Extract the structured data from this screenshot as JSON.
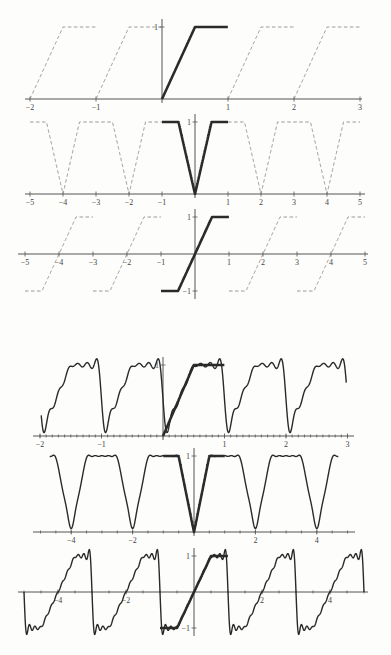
{
  "figure": {
    "caption_fragment": "",
    "panels_count": 6
  },
  "chart_data": [
    {
      "type": "line",
      "title": "Periodic extension of f (period 1)",
      "function_on_base": {
        "x": [
          0,
          0.5,
          1
        ],
        "y": [
          0,
          1,
          1
        ]
      },
      "extension": "periodic",
      "period": 1,
      "xlim": [
        -2,
        3
      ],
      "ylim": [
        0,
        1
      ],
      "xticks": [
        -2,
        -1,
        1,
        2,
        3
      ],
      "xtick_labels": [
        "−2",
        "−1",
        "1",
        "2",
        "3"
      ],
      "yticks": [
        1
      ],
      "ytick_labels": [
        "1"
      ],
      "series": [
        {
          "name": "f on [0,1]",
          "style": "solid-thick"
        },
        {
          "name": "periodic extension",
          "style": "dashed"
        }
      ],
      "px": {
        "x0": 162,
        "unit": 66,
        "y0": 99,
        "yunit": 72,
        "xmin": 25,
        "xmax": 362
      }
    },
    {
      "type": "line",
      "title": "Even extension of f (period 2)",
      "function_on_base": {
        "x": [
          -1,
          -0.5,
          0,
          0.5,
          1
        ],
        "y": [
          1,
          1,
          0,
          1,
          1
        ]
      },
      "extension": "even",
      "period": 2,
      "xlim": [
        -5,
        5
      ],
      "ylim": [
        0,
        1
      ],
      "xticks": [
        -5,
        -4,
        -3,
        -2,
        -1,
        1,
        2,
        3,
        4,
        5
      ],
      "xtick_labels": [
        "−5",
        "−4",
        "−3",
        "−2",
        "−1",
        "1",
        "2",
        "3",
        "4",
        "5"
      ],
      "yticks": [
        1
      ],
      "ytick_labels": [
        "1"
      ],
      "series": [
        {
          "name": "f even on [-1,1]",
          "style": "solid-thick"
        },
        {
          "name": "even periodic extension",
          "style": "dashed"
        }
      ],
      "px": {
        "x0": 195,
        "unit": 33,
        "y0": 194,
        "yunit": 72,
        "xmin": 25,
        "xmax": 365
      }
    },
    {
      "type": "line",
      "title": "Odd extension of f (period 2)",
      "function_on_base": {
        "x": [
          -1,
          -0.5,
          0,
          0.5,
          1
        ],
        "y": [
          -1,
          -1,
          0,
          1,
          1
        ]
      },
      "extension": "odd",
      "period": 2,
      "xlim": [
        -5,
        5
      ],
      "ylim": [
        -1,
        1
      ],
      "xticks": [
        -5,
        -4,
        -3,
        -2,
        -1,
        1,
        2,
        3,
        4,
        5
      ],
      "xtick_labels": [
        "−5",
        "−4",
        "−3",
        "−2",
        "−1",
        "1",
        "2",
        "3",
        "4",
        "5"
      ],
      "yticks": [
        1,
        -1
      ],
      "ytick_labels": [
        "1",
        "−1"
      ],
      "series": [
        {
          "name": "f odd on [-1,1]",
          "style": "solid-thick"
        },
        {
          "name": "odd periodic extension",
          "style": "dashed"
        }
      ],
      "px": {
        "x0": 195,
        "unit": 34,
        "y0": 254,
        "yunit": 37,
        "xmin": 18,
        "xmax": 368
      }
    },
    {
      "type": "line",
      "title": "Fourier partial sum of periodic extension",
      "extension": "periodic",
      "period": 1,
      "harmonics": 6,
      "xlim": [
        -2,
        3
      ],
      "ylim": [
        0,
        1
      ],
      "xticks": [
        -2,
        -1,
        1,
        2,
        3
      ],
      "xtick_labels": [
        "−2",
        "−1",
        "1",
        "2",
        "3"
      ],
      "minor_ticks_per_unit": 10,
      "yticks": [
        1
      ],
      "ytick_labels": [
        "1"
      ],
      "series": [
        {
          "name": "f on [0,1]",
          "style": "solid-thick"
        },
        {
          "name": "Fourier approximation",
          "style": "solid"
        }
      ],
      "px": {
        "x0": 163,
        "unit": 61.5,
        "y0": 436,
        "yunit": 71,
        "xmin": 33,
        "xmax": 354,
        "fmin": -1.98,
        "fmax": 2.98
      }
    },
    {
      "type": "line",
      "title": "Fourier cosine partial sum (even extension)",
      "extension": "even",
      "period": 2,
      "harmonics": 9,
      "xlim": [
        -5,
        5
      ],
      "ylim": [
        0,
        1
      ],
      "xticks": [
        -4,
        -2,
        2,
        4
      ],
      "xtick_labels": [
        "−4",
        "−2",
        "2",
        "4"
      ],
      "minor_ticks_per_unit": 2,
      "yticks": [
        1
      ],
      "ytick_labels": [
        "1"
      ],
      "series": [
        {
          "name": "f even on [-1,1]",
          "style": "solid-thick"
        },
        {
          "name": "Fourier cosine approximation",
          "style": "solid"
        }
      ],
      "px": {
        "x0": 194,
        "unit": 30.7,
        "y0": 532,
        "yunit": 76,
        "xmin": 33,
        "xmax": 355,
        "fmin": -4.7,
        "fmax": 4.7
      }
    },
    {
      "type": "line",
      "title": "Fourier sine partial sum (odd extension)",
      "extension": "odd",
      "period": 2,
      "harmonics": 12,
      "xlim": [
        -5,
        5
      ],
      "ylim": [
        -1,
        1
      ],
      "xticks": [
        -4,
        -2,
        2,
        4
      ],
      "xtick_labels": [
        "−4",
        "−2",
        "2",
        "4"
      ],
      "minor_ticks_per_unit": 2,
      "yticks": [
        1,
        -1
      ],
      "ytick_labels": [
        "1",
        "−1"
      ],
      "series": [
        {
          "name": "f odd on [-1,1]",
          "style": "solid-thick"
        },
        {
          "name": "Fourier sine approximation",
          "style": "solid"
        }
      ],
      "px": {
        "x0": 194,
        "unit": 34,
        "y0": 592,
        "yunit": 36,
        "xmin": 18,
        "xmax": 368,
        "fmin": -5,
        "fmax": 5
      }
    }
  ]
}
